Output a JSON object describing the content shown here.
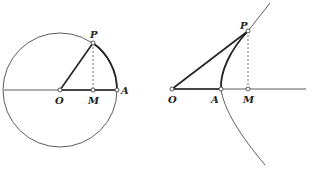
{
  "figures": [
    {
      "name": "circle-figure",
      "labels": {
        "P": "P",
        "O": "O",
        "M": "M",
        "A": "A"
      }
    },
    {
      "name": "hyperbola-figure",
      "labels": {
        "P": "P",
        "O": "O",
        "A": "A",
        "M": "M"
      }
    }
  ]
}
